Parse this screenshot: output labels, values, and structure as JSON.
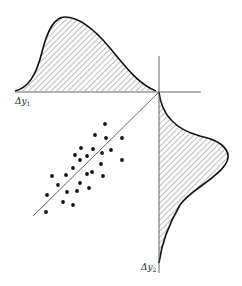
{
  "figure": {
    "labels": {
      "x_axis": "Δy",
      "x_axis_sub": "1",
      "y_axis": "Δy",
      "y_axis_sub": "2"
    },
    "colors": {
      "ink": "#111111",
      "axis": "#555555",
      "hatch": "#666666"
    }
  },
  "chart_data": {
    "type": "scatter",
    "title": "",
    "xlabel": "Δy1",
    "ylabel": "Δy2",
    "grid": false,
    "marginals": {
      "top": "right-skewed density (Δy1)",
      "right": "right-skewed density (Δy2)"
    },
    "regression_line": true,
    "points": [
      [
        105,
        124
      ],
      [
        95,
        135
      ],
      [
        106,
        138
      ],
      [
        122,
        138
      ],
      [
        81,
        148
      ],
      [
        93,
        149
      ],
      [
        75,
        155
      ],
      [
        87,
        156
      ],
      [
        102,
        153
      ],
      [
        111,
        150
      ],
      [
        80,
        160
      ],
      [
        73,
        168
      ],
      [
        101,
        164
      ],
      [
        122,
        160
      ],
      [
        52,
        176
      ],
      [
        66,
        175
      ],
      [
        87,
        174
      ],
      [
        92,
        172
      ],
      [
        103,
        176
      ],
      [
        58,
        185
      ],
      [
        80,
        183
      ],
      [
        89,
        188
      ],
      [
        47,
        195
      ],
      [
        67,
        192
      ],
      [
        77,
        191
      ],
      [
        63,
        202
      ],
      [
        73,
        205
      ],
      [
        46,
        212
      ]
    ]
  }
}
